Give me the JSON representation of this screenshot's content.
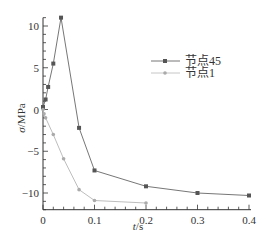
{
  "chart_data": {
    "type": "line",
    "title": "",
    "xlabel": "t/s",
    "ylabel": "σ/MPa",
    "xlim": [
      0,
      0.4
    ],
    "ylim": [
      -12,
      11
    ],
    "xticks": [
      0,
      0.1,
      0.2,
      0.3,
      0.4
    ],
    "xtick_labels": [
      "0",
      "0.1",
      "0.2",
      "0.3",
      "0.4"
    ],
    "yticks": [
      -10,
      -5,
      0,
      5,
      10
    ],
    "ytick_labels": [
      "−10",
      "−5",
      "0",
      "5",
      "10"
    ],
    "grid": false,
    "legend_position": "upper right (inside)",
    "series": [
      {
        "name": "节点45",
        "color": "#666666",
        "marker": "square",
        "x": [
          0,
          0.005,
          0.01,
          0.02,
          0.035,
          0.07,
          0.1,
          0.2,
          0.3,
          0.4
        ],
        "y": [
          0.3,
          1.2,
          2.7,
          5.5,
          11.0,
          -2.2,
          -7.3,
          -9.2,
          -10.0,
          -10.3
        ]
      },
      {
        "name": "节点1",
        "color": "#b5b5b5",
        "marker": "circle",
        "x": [
          0,
          0.002,
          0.005,
          0.02,
          0.04,
          0.07,
          0.1,
          0.2
        ],
        "y": [
          0.0,
          -0.5,
          -1.0,
          -3.0,
          -5.9,
          -9.6,
          -10.9,
          -11.2
        ]
      }
    ]
  },
  "legend": {
    "items": [
      {
        "label": "节点45"
      },
      {
        "label": "节点1"
      }
    ]
  },
  "axes": {
    "xlabel_italic": "t",
    "xlabel_unit": "/s",
    "ylabel_italic": "σ",
    "ylabel_unit": "/MPa"
  }
}
